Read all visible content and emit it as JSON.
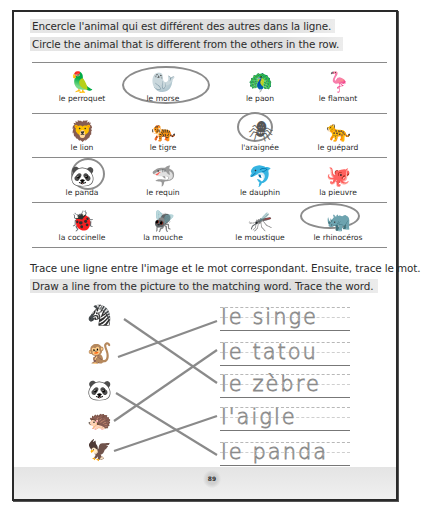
{
  "section1": {
    "instruction_fr": "Encercle l'animal qui est différent des autres dans la ligne.",
    "instruction_en": "Circle the animal that is different from the others in the row.",
    "rows": [
      {
        "items": [
          {
            "label": "le perroquet",
            "icon": "🦜",
            "circled": false
          },
          {
            "label": "le morse",
            "icon": "🦭",
            "circled": true
          },
          {
            "label": "le paon",
            "icon": "🦚",
            "circled": false
          },
          {
            "label": "le flamant",
            "icon": "🦩",
            "circled": false
          }
        ]
      },
      {
        "items": [
          {
            "label": "le lion",
            "icon": "🦁",
            "circled": false
          },
          {
            "label": "le tigre",
            "icon": "🐅",
            "circled": false
          },
          {
            "label": "l'araignée",
            "icon": "🕷",
            "circled": true
          },
          {
            "label": "le guépard",
            "icon": "🐆",
            "circled": false
          }
        ]
      },
      {
        "items": [
          {
            "label": "le panda",
            "icon": "🐼",
            "circled": true
          },
          {
            "label": "le requin",
            "icon": "🦈",
            "circled": false
          },
          {
            "label": "le dauphin",
            "icon": "🐬",
            "circled": false
          },
          {
            "label": "la pieuvre",
            "icon": "🐙",
            "circled": false
          }
        ]
      },
      {
        "items": [
          {
            "label": "la coccinelle",
            "icon": "🐞",
            "circled": false
          },
          {
            "label": "la mouche",
            "icon": "🪰",
            "circled": false
          },
          {
            "label": "le moustique",
            "icon": "🦟",
            "circled": false
          },
          {
            "label": "le rhinocéros",
            "icon": "🦏",
            "circled": true
          }
        ]
      }
    ]
  },
  "section2": {
    "instruction_fr": "Trace une ligne entre l'image et le mot correspondant. Ensuite, trace le mot.",
    "instruction_en": "Draw a line from the picture to the matching word. Trace the word.",
    "pictures": [
      {
        "name": "zebra",
        "icon": "🦓"
      },
      {
        "name": "monkey",
        "icon": "🐒"
      },
      {
        "name": "panda",
        "icon": "🐼"
      },
      {
        "name": "armadillo",
        "icon": "🦔"
      },
      {
        "name": "eagle",
        "icon": "🦅"
      }
    ],
    "words": [
      "le singe",
      "le tatou",
      "le zèbre",
      "l'aigle",
      "le panda"
    ],
    "matches": [
      [
        0,
        2
      ],
      [
        1,
        0
      ],
      [
        2,
        4
      ],
      [
        3,
        1
      ],
      [
        4,
        3
      ]
    ]
  },
  "footer": {
    "page_number": "89"
  }
}
